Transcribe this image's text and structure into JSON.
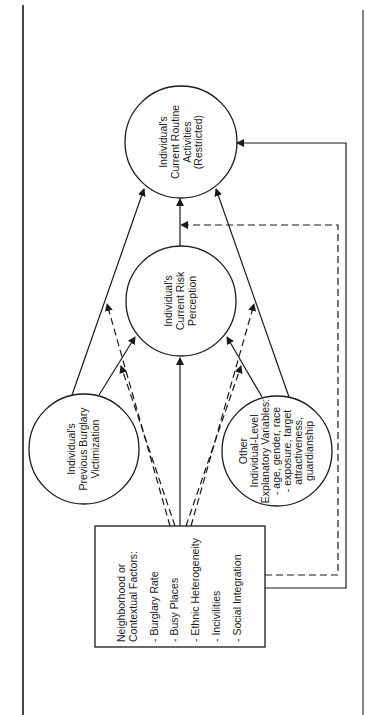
{
  "diagram": {
    "orientation": "rotated-90-ccw",
    "colors": {
      "line": "#1a1a1a",
      "background": "#ffffff"
    },
    "page_borders": {
      "left_x": 23,
      "right_x": 363
    },
    "nodes": {
      "routine_activities": {
        "lines": [
          "Individual's",
          "Current Routine",
          "Activities",
          "(Restricted)"
        ],
        "cx": 181,
        "cy": 142,
        "r": 56
      },
      "risk_perception": {
        "lines": [
          "Individual's",
          "Current Risk",
          "Perception"
        ],
        "cx": 181,
        "cy": 301,
        "r": 55
      },
      "previous_victimization": {
        "lines": [
          "Individual's",
          "Previous Burglary",
          "Victimization"
        ],
        "cx": 84,
        "cy": 449,
        "r": 55
      },
      "other_variables": {
        "lines": [
          "Other",
          "Individual-Level",
          "Explanatory Variables:",
          "- age, gender, race",
          "- exposure, target",
          "  attractiveness,",
          "  guardianship"
        ],
        "cx": 277,
        "cy": 451,
        "r": 55
      },
      "neighborhood_factors": {
        "title_lines": [
          "Neighborhood or",
          "Contextual Factors:"
        ],
        "items": [
          "- Burglary Rate",
          "- Busy Places",
          "- Ethnic Heterogeneity",
          "- Incivilities",
          "- Social Integration"
        ],
        "x": 95,
        "y": 526,
        "w": 170,
        "h": 121
      }
    },
    "edges": [
      {
        "from": "neighborhood_factors",
        "to": "risk_perception",
        "style": "solid"
      },
      {
        "from": "risk_perception",
        "to": "routine_activities",
        "style": "solid"
      },
      {
        "from": "previous_victimization",
        "to": "routine_activities",
        "style": "solid"
      },
      {
        "from": "previous_victimization",
        "to": "risk_perception",
        "style": "solid"
      },
      {
        "from": "other_variables",
        "to": "routine_activities",
        "style": "solid"
      },
      {
        "from": "other_variables",
        "to": "risk_perception",
        "style": "solid"
      },
      {
        "from": "neighborhood_factors",
        "to": "routine_activities",
        "style": "solid",
        "route": "right-loop-outer"
      },
      {
        "from": "neighborhood_factors",
        "to": "routine_activities",
        "style": "dashed",
        "route": "right-loop-inner",
        "label": "moderating"
      },
      {
        "from": "neighborhood_factors",
        "to": "previous_victimization->routine_activities",
        "style": "dashed"
      },
      {
        "from": "neighborhood_factors",
        "to": "previous_victimization->risk_perception",
        "style": "dashed"
      },
      {
        "from": "neighborhood_factors",
        "to": "other_variables->routine_activities",
        "style": "dashed"
      },
      {
        "from": "neighborhood_factors",
        "to": "other_variables->risk_perception",
        "style": "dashed"
      }
    ]
  }
}
